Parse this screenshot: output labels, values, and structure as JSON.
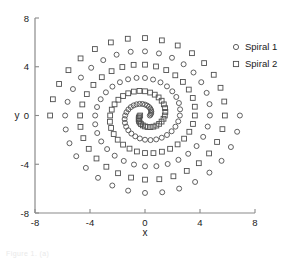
{
  "figure": {
    "background": "#ffffff",
    "marker_color": "#4f4f4f",
    "axis_color": "#8a8a8a"
  },
  "caption_fragment": "Figure 1. (a)",
  "chart_data": {
    "type": "scatter",
    "title": "",
    "subtitle": "",
    "xlabel": "x",
    "ylabel": "y",
    "xlim": [
      -8,
      8
    ],
    "ylim": [
      -8,
      8
    ],
    "xticks": [
      -8,
      -4,
      0,
      4,
      8
    ],
    "yticks": [
      -8,
      -4,
      0,
      4,
      8
    ],
    "xtick_labels": [
      "-8",
      "-4",
      "0",
      "4",
      "8"
    ],
    "ytick_labels": [
      "-8",
      "-4",
      "0",
      "4",
      "8"
    ],
    "grid": false,
    "legend_position": "upper-right-outside",
    "spiral_model": {
      "description": "Two interleaved Archimedean spirals, 180 degrees out of phase",
      "n_points_per_spiral": 97,
      "theta_start_deg": 0,
      "theta_end_deg": 1080,
      "radius_start": 0.35,
      "radius_end": 6.9,
      "phase_offset_deg": 180,
      "center": [
        0,
        0
      ]
    },
    "series": [
      {
        "name": "Spiral 1",
        "marker": "circle",
        "phase_deg": 0,
        "color": "#4f4f4f",
        "n_points": 97
      },
      {
        "name": "Spiral 2",
        "marker": "square",
        "phase_deg": 180,
        "color": "#4f4f4f",
        "n_points": 97
      }
    ],
    "legend": [
      {
        "label": "Spiral 1",
        "marker": "circle"
      },
      {
        "label": "Spiral 2",
        "marker": "square"
      }
    ]
  }
}
